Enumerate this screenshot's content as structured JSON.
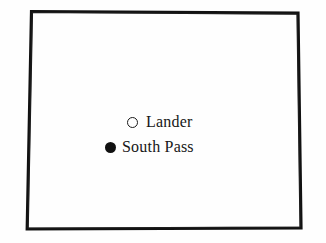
{
  "figure": {
    "name": "state-outline-locator-map",
    "background_color": "#fefefe",
    "outline_color": "#111111",
    "outline_width_px": 3,
    "outline_shape": "hand-drawn quadrilateral state boundary",
    "outline_corners": [
      {
        "label": "top-left",
        "x": 31,
        "y": 11
      },
      {
        "label": "top-right",
        "x": 298,
        "y": 13
      },
      {
        "label": "bottom-right",
        "x": 301,
        "y": 228
      },
      {
        "label": "bottom-left",
        "x": 27,
        "y": 229
      }
    ]
  },
  "markers": [
    {
      "id": "lander",
      "label": "Lander",
      "symbol": "open-circle-marker",
      "fill": "none",
      "stroke_color": "#1a1a1a",
      "x": 133,
      "y": 120
    },
    {
      "id": "south-pass",
      "label": "South Pass",
      "symbol": "filled-circle-marker",
      "fill": "#111111",
      "stroke_color": "#111111",
      "x": 111,
      "y": 145
    }
  ]
}
